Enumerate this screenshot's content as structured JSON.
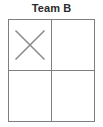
{
  "board": {
    "title": "Team B",
    "title_color": "#2b2b2b",
    "grid_line_color": "#7d7f82",
    "mark_color": "#8a8c8f",
    "background_color": "#ffffff",
    "rows": 2,
    "columns": 2,
    "cells": [
      {
        "row": 0,
        "col": 0,
        "mark": "x",
        "mark_icon": "x-mark-icon",
        "label": "cell-row-0-col-0"
      },
      {
        "row": 0,
        "col": 1,
        "mark": "",
        "mark_icon": "",
        "label": "cell-row-0-col-1"
      },
      {
        "row": 1,
        "col": 0,
        "mark": "",
        "mark_icon": "",
        "label": "cell-row-1-col-0"
      },
      {
        "row": 1,
        "col": 1,
        "mark": "",
        "mark_icon": "",
        "label": "cell-row-1-col-1"
      }
    ]
  }
}
